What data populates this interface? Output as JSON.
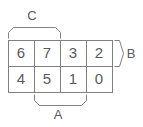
{
  "figure": {
    "type": "grid-with-braces",
    "line_color": "#808080",
    "text_color": "#5a5a5a",
    "background": "#ffffff",
    "grid": {
      "rows": 2,
      "columns": 4,
      "cells": [
        [
          "6",
          "7",
          "3",
          "2"
        ],
        [
          "4",
          "5",
          "1",
          "0"
        ]
      ]
    },
    "braces": [
      {
        "label": "C",
        "orientation": "top",
        "spans": "columns 1-2 of top row",
        "label_position": "above"
      },
      {
        "label": "B",
        "orientation": "right",
        "spans": "top row",
        "label_position": "right"
      },
      {
        "label": "A",
        "orientation": "bottom",
        "spans": "columns 2-3 of bottom row",
        "label_position": "below"
      }
    ]
  }
}
